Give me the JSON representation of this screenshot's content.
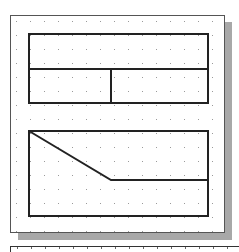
{
  "diagram": {
    "colors": {
      "background": "#ffffff",
      "panel_border": "#555555",
      "shadow": "#a8a8a8",
      "grid_dot": "#9a9a9a",
      "stroke": "#222222"
    },
    "grid": {
      "spacing": 14,
      "origin_x": 16,
      "origin_y": 21
    },
    "shapes": [
      {
        "id": "top-rectangle",
        "type": "rect",
        "x": 29,
        "y": 34,
        "width": 179,
        "height": 69
      },
      {
        "id": "top-horizontal-divider",
        "type": "line",
        "x1": 29,
        "y1": 69,
        "x2": 208,
        "y2": 69
      },
      {
        "id": "top-vertical-divider",
        "type": "line",
        "x1": 111,
        "y1": 69,
        "x2": 111,
        "y2": 103
      },
      {
        "id": "bottom-rectangle",
        "type": "rect",
        "x": 29,
        "y": 131,
        "width": 179,
        "height": 85
      },
      {
        "id": "bottom-diagonal-edge",
        "type": "polyline",
        "points": "29,131 111,180 208,180"
      }
    ]
  }
}
